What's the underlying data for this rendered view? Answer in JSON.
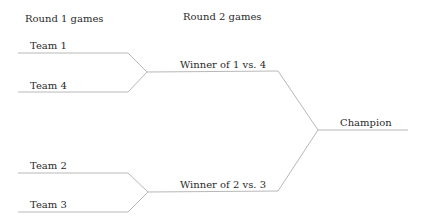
{
  "headers": {
    "round1": "Round 1 games",
    "round2": "Round 2 games"
  },
  "round1": {
    "teams": [
      "Team 1",
      "Team 4",
      "Team 2",
      "Team 3"
    ]
  },
  "round2": {
    "matches": [
      "Winner of 1 vs. 4",
      "Winner of 2 vs. 3"
    ]
  },
  "final": {
    "label": "Champion"
  }
}
